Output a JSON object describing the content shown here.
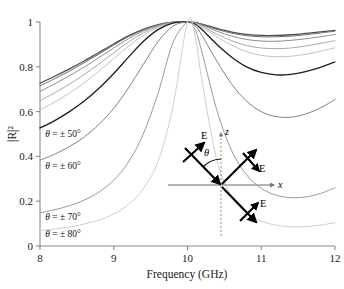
{
  "chart_data": {
    "type": "line",
    "title": "",
    "xlabel": "Frequency (GHz)",
    "ylabel": "|R|²",
    "xlim": [
      8,
      12
    ],
    "ylim": [
      0,
      1
    ],
    "xticks": [
      "8",
      "9",
      "10",
      "11",
      "12"
    ],
    "yticks": [
      "0",
      "0.2",
      "0.4",
      "0.6",
      "0.8",
      "1"
    ],
    "grid": false,
    "legend_position": "inline-left",
    "x": [
      8.0,
      8.2,
      8.4,
      8.6,
      8.8,
      9.0,
      9.2,
      9.4,
      9.6,
      9.8,
      10.0,
      10.1,
      10.2,
      10.4,
      10.6,
      10.8,
      11.0,
      11.2,
      11.4,
      11.6,
      11.8,
      12.0
    ],
    "series": [
      {
        "name": "θ = ± 0°",
        "color": "#4d4d4d",
        "values": [
          0.727,
          0.758,
          0.791,
          0.826,
          0.864,
          0.902,
          0.938,
          0.967,
          0.988,
          0.999,
          1.0,
          0.998,
          0.99,
          0.971,
          0.955,
          0.945,
          0.94,
          0.94,
          0.943,
          0.949,
          0.956,
          0.963
        ]
      },
      {
        "name": "θ = ± 10°",
        "color": "#6e6e6e",
        "values": [
          0.715,
          0.747,
          0.781,
          0.818,
          0.857,
          0.897,
          0.935,
          0.965,
          0.987,
          0.999,
          1.0,
          0.997,
          0.988,
          0.967,
          0.95,
          0.939,
          0.934,
          0.934,
          0.937,
          0.943,
          0.951,
          0.959
        ]
      },
      {
        "name": "θ = ± 20°",
        "color": "#8c8c8c",
        "values": [
          0.69,
          0.724,
          0.76,
          0.799,
          0.841,
          0.884,
          0.926,
          0.96,
          0.984,
          0.998,
          1.0,
          0.996,
          0.985,
          0.959,
          0.937,
          0.922,
          0.915,
          0.914,
          0.918,
          0.925,
          0.934,
          0.944
        ]
      },
      {
        "name": "θ = ± 30°",
        "color": "#a8a8a8",
        "values": [
          0.648,
          0.684,
          0.723,
          0.766,
          0.813,
          0.862,
          0.911,
          0.951,
          0.98,
          0.997,
          1.0,
          0.995,
          0.98,
          0.946,
          0.916,
          0.895,
          0.884,
          0.881,
          0.884,
          0.893,
          0.904,
          0.917
        ]
      },
      {
        "name": "θ = ± 40°",
        "color": "#c4c4c4",
        "values": [
          0.607,
          0.643,
          0.683,
          0.729,
          0.781,
          0.836,
          0.892,
          0.94,
          0.975,
          0.996,
          1.0,
          0.994,
          0.976,
          0.934,
          0.896,
          0.868,
          0.851,
          0.845,
          0.847,
          0.856,
          0.869,
          0.885
        ]
      },
      {
        "name": "θ = ± 50°",
        "color": "#1c1c1c",
        "values": [
          0.527,
          0.56,
          0.6,
          0.647,
          0.704,
          0.77,
          0.843,
          0.913,
          0.966,
          0.995,
          1.0,
          0.991,
          0.965,
          0.9,
          0.843,
          0.8,
          0.775,
          0.764,
          0.766,
          0.778,
          0.797,
          0.822
        ]
      },
      {
        "name": "θ = ± 60°",
        "color": "#808080",
        "values": [
          0.383,
          0.41,
          0.444,
          0.487,
          0.543,
          0.615,
          0.706,
          0.81,
          0.912,
          0.981,
          1.0,
          0.985,
          0.938,
          0.824,
          0.722,
          0.647,
          0.6,
          0.578,
          0.575,
          0.589,
          0.616,
          0.654
        ]
      },
      {
        "name": "θ = ± 70°",
        "color": "#9a9a9a",
        "values": [
          0.148,
          0.162,
          0.18,
          0.205,
          0.241,
          0.294,
          0.375,
          0.5,
          0.681,
          0.905,
          1.0,
          0.969,
          0.86,
          0.604,
          0.425,
          0.318,
          0.258,
          0.227,
          0.216,
          0.219,
          0.234,
          0.26
        ]
      },
      {
        "name": "θ = ± 80°",
        "color": "#cfcfcf",
        "values": [
          0.069,
          0.076,
          0.085,
          0.098,
          0.116,
          0.143,
          0.186,
          0.256,
          0.377,
          0.62,
          1.0,
          0.945,
          0.73,
          0.38,
          0.22,
          0.147,
          0.111,
          0.093,
          0.086,
          0.086,
          0.093,
          0.104
        ]
      }
    ],
    "annotations": [
      {
        "name": "label-theta-50",
        "text": "θ = ± 50°",
        "x": 8.07,
        "y": 0.485
      },
      {
        "name": "label-theta-60",
        "text": "θ = ± 60°",
        "x": 8.07,
        "y": 0.342
      },
      {
        "name": "label-theta-70",
        "text": "θ = ± 70°",
        "x": 8.07,
        "y": 0.118
      },
      {
        "name": "label-theta-80",
        "text": "θ = ± 80°",
        "x": 8.07,
        "y": 0.038
      }
    ]
  },
  "inset": {
    "name": "polarization-geometry-inset",
    "axis_z_label": "z",
    "axis_x_label": "x",
    "angle_label": "θ",
    "field_labels": [
      "E",
      "E",
      "E"
    ]
  }
}
